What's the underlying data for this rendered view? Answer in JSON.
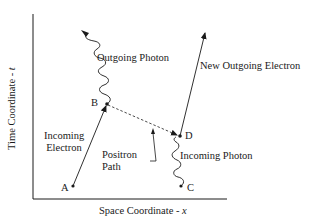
{
  "diagram": {
    "type": "feynman-spacetime-diagram",
    "axes": {
      "y_label_text": "Time Coordinate - ",
      "y_label_var": "t",
      "x_label_text": "Space Coordinate - ",
      "x_label_var": "x"
    },
    "points": {
      "A": "A",
      "B": "B",
      "C": "C",
      "D": "D"
    },
    "labels": {
      "outgoing_photon": "Outgoing Photon",
      "new_outgoing_electron": "New Outgoing Electron",
      "incoming_electron_line1": "Incoming",
      "incoming_electron_line2": "Electron",
      "positron_path_line1": "Positron",
      "positron_path_line2": "Path",
      "incoming_photon": "Incoming Photon"
    },
    "colors": {
      "stroke": "#1a1a1a",
      "background": "#ffffff"
    }
  }
}
